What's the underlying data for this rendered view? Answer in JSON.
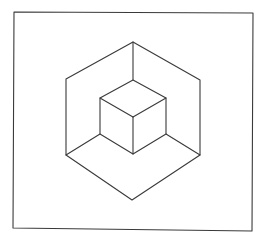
{
  "figure": {
    "stroke_color": "#3a3a3a",
    "background_color": "#ffffff",
    "frame": {
      "points": [
        [
          14,
          12
        ],
        [
          253,
          13
        ],
        [
          252,
          231
        ],
        [
          13,
          228
        ]
      ]
    },
    "outer_hexagon": {
      "top": [
        133,
        42
      ],
      "right_top": [
        200,
        80
      ],
      "right_bottom": [
        200,
        155
      ],
      "bottom": [
        132,
        200
      ],
      "left_bottom": [
        66,
        155
      ],
      "left_top": [
        66,
        79
      ]
    },
    "inner_cube": {
      "top": [
        133,
        80
      ],
      "right_top": [
        166,
        98
      ],
      "right_bottom": [
        166,
        134
      ],
      "bottom": [
        133,
        154
      ],
      "left_bottom": [
        100,
        134
      ],
      "left_top": [
        100,
        98
      ],
      "center": [
        133,
        117
      ]
    }
  }
}
